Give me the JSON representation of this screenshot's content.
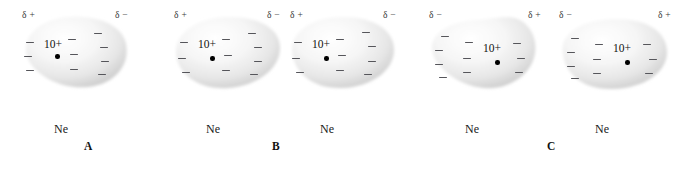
{
  "figure": {
    "background_color": "#ffffff",
    "cloud_color": "#e8e8e8",
    "dash_color": "#55555a",
    "nucleus_color": "#000000",
    "panels": [
      {
        "letter": "A",
        "letter_x": 84,
        "letter_y": 140,
        "atoms": [
          {
            "symbol": "Ne",
            "charge": "10+",
            "delta_left": "δ +",
            "delta_right": "δ −",
            "x": 18,
            "y": 10,
            "w": 112,
            "h": 82,
            "blob_path": "M 8 42 C 6 24 24 9 50 7 C 78 5 104 14 108 34 C 112 54 98 74 70 77 C 40 80 11 62 8 42 Z",
            "charge_x": 26,
            "charge_y": 28,
            "nucleus_x": 37,
            "nucleus_y": 44,
            "dashes": [
              {
                "x": 8,
                "y": 32
              },
              {
                "x": 6,
                "y": 46
              },
              {
                "x": 8,
                "y": 60
              },
              {
                "x": 50,
                "y": 29
              },
              {
                "x": 52,
                "y": 44
              },
              {
                "x": 52,
                "y": 59
              },
              {
                "x": 76,
                "y": 23
              },
              {
                "x": 82,
                "y": 37
              },
              {
                "x": 83,
                "y": 51
              },
              {
                "x": 80,
                "y": 64
              }
            ],
            "symbol_x": 36,
            "symbol_y": 112
          }
        ]
      },
      {
        "letter": "B",
        "letter_x": 272,
        "letter_y": 140,
        "atoms": [
          {
            "symbol": "Ne",
            "charge": "10+",
            "delta_left": "δ +",
            "delta_right": "δ −",
            "x": 170,
            "y": 10,
            "w": 112,
            "h": 82,
            "blob_path": "M 6 44 C 4 24 26 8 56 7 C 88 6 110 18 110 38 C 110 58 88 76 58 78 C 28 80 8 64 6 44 Z",
            "charge_x": 28,
            "charge_y": 28,
            "nucleus_x": 40,
            "nucleus_y": 46,
            "dashes": [
              {
                "x": 10,
                "y": 32
              },
              {
                "x": 8,
                "y": 48
              },
              {
                "x": 12,
                "y": 62
              },
              {
                "x": 52,
                "y": 29
              },
              {
                "x": 54,
                "y": 45
              },
              {
                "x": 52,
                "y": 60
              },
              {
                "x": 78,
                "y": 23
              },
              {
                "x": 84,
                "y": 37
              },
              {
                "x": 84,
                "y": 51
              },
              {
                "x": 80,
                "y": 64
              }
            ],
            "symbol_x": 36,
            "symbol_y": 112
          },
          {
            "symbol": "Ne",
            "charge": "10+",
            "delta_left": "δ +",
            "delta_right": "δ −",
            "x": 286,
            "y": 10,
            "w": 112,
            "h": 82,
            "blob_path": "M 6 42 C 4 22 26 7 56 7 C 88 7 108 20 108 40 C 108 60 86 77 56 78 C 26 79 8 62 6 42 Z",
            "charge_x": 26,
            "charge_y": 28,
            "nucleus_x": 38,
            "nucleus_y": 46,
            "dashes": [
              {
                "x": 8,
                "y": 32
              },
              {
                "x": 6,
                "y": 48
              },
              {
                "x": 10,
                "y": 62
              },
              {
                "x": 50,
                "y": 29
              },
              {
                "x": 52,
                "y": 45
              },
              {
                "x": 50,
                "y": 60
              },
              {
                "x": 76,
                "y": 22
              },
              {
                "x": 82,
                "y": 36
              },
              {
                "x": 82,
                "y": 51
              },
              {
                "x": 78,
                "y": 64
              }
            ],
            "symbol_x": 34,
            "symbol_y": 112
          }
        ]
      },
      {
        "letter": "C",
        "letter_x": 547,
        "letter_y": 140,
        "atoms": [
          {
            "symbol": "Ne",
            "charge": "10+",
            "delta_left": "δ −",
            "delta_right": "δ +",
            "x": 425,
            "y": 10,
            "w": 118,
            "h": 82,
            "blob_path": "M 8 44 C 2 26 22 12 50 10 C 78 8 92 2 104 18 C 116 34 112 62 84 74 C 52 88 14 64 8 44 Z",
            "charge_x": 58,
            "charge_y": 32,
            "nucleus_x": 70,
            "nucleus_y": 50,
            "dashes": [
              {
                "x": 16,
                "y": 26
              },
              {
                "x": 10,
                "y": 40
              },
              {
                "x": 10,
                "y": 54
              },
              {
                "x": 14,
                "y": 67
              },
              {
                "x": 40,
                "y": 32
              },
              {
                "x": 38,
                "y": 48
              },
              {
                "x": 38,
                "y": 62
              },
              {
                "x": 88,
                "y": 33
              },
              {
                "x": 92,
                "y": 48
              },
              {
                "x": 90,
                "y": 62
              }
            ],
            "symbol_x": 40,
            "symbol_y": 112
          },
          {
            "symbol": "Ne",
            "charge": "10+",
            "delta_left": "δ −",
            "delta_right": "δ +",
            "x": 555,
            "y": 10,
            "w": 118,
            "h": 82,
            "blob_path": "M 8 44 C 4 24 26 10 58 9 C 92 8 112 22 112 42 C 112 62 90 78 58 79 C 26 80 10 62 8 44 Z",
            "charge_x": 58,
            "charge_y": 32,
            "nucleus_x": 70,
            "nucleus_y": 50,
            "dashes": [
              {
                "x": 16,
                "y": 28
              },
              {
                "x": 12,
                "y": 42
              },
              {
                "x": 12,
                "y": 56
              },
              {
                "x": 16,
                "y": 68
              },
              {
                "x": 40,
                "y": 34
              },
              {
                "x": 38,
                "y": 49
              },
              {
                "x": 38,
                "y": 63
              },
              {
                "x": 88,
                "y": 34
              },
              {
                "x": 94,
                "y": 49
              },
              {
                "x": 90,
                "y": 63
              }
            ],
            "symbol_x": 40,
            "symbol_y": 112
          }
        ]
      }
    ]
  }
}
